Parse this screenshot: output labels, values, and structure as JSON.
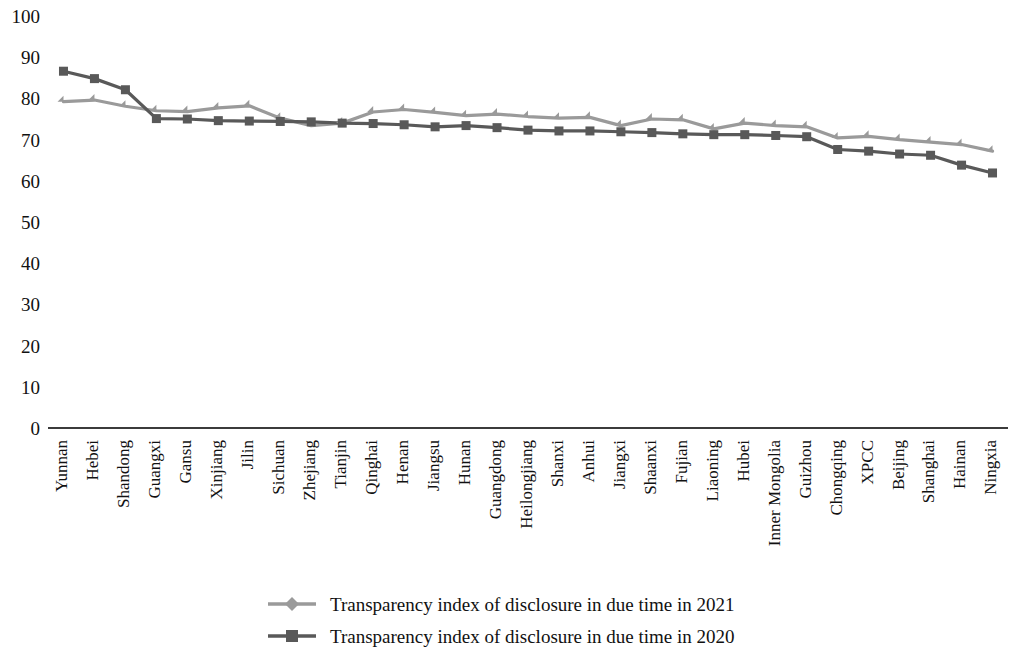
{
  "chart_data": {
    "type": "line",
    "title": "",
    "xlabel": "",
    "ylabel": "",
    "ylim": [
      0,
      100
    ],
    "ytick_step": 10,
    "yticks": [
      100,
      90,
      80,
      70,
      60,
      50,
      40,
      30,
      20,
      10,
      0
    ],
    "grid": false,
    "legend_position": "bottom",
    "categories": [
      "Yunnan",
      "Hebei",
      "Shandong",
      "Guangxi",
      "Gansu",
      "Xinjiang",
      "Jilin",
      "Sichuan",
      "Zhejiang",
      "Tianjin",
      "Qinghai",
      "Henan",
      "Jiangsu",
      "Hunan",
      "Guangdong",
      "Heilongjiang",
      "Shanxi",
      "Anhui",
      "Jiangxi",
      "Shaanxi",
      "Fujian",
      "Liaoning",
      "Hubei",
      "Inner Mongolia",
      "Guizhou",
      "Chongqing",
      "XPCC",
      "Beijing",
      "Shanghai",
      "Hainan",
      "Ningxia"
    ],
    "series": [
      {
        "name": "Transparency index of disclosure in due time in 2021",
        "color": "#9a9a9a",
        "marker": "diamond",
        "values": [
          79.2,
          79.6,
          78.1,
          77.0,
          76.8,
          77.7,
          78.2,
          75.2,
          73.4,
          74.0,
          76.7,
          77.3,
          76.6,
          75.8,
          76.2,
          75.6,
          75.2,
          75.4,
          73.4,
          75.0,
          74.8,
          72.6,
          74.0,
          73.4,
          73.1,
          70.4,
          70.8,
          70.0,
          69.4,
          68.8,
          67.2
        ]
      },
      {
        "name": "Transparency index of disclosure in due time in 2020",
        "color": "#595959",
        "marker": "square",
        "values": [
          86.6,
          84.8,
          82.1,
          75.1,
          75.0,
          74.6,
          74.5,
          74.4,
          74.3,
          74.0,
          73.9,
          73.6,
          73.1,
          73.4,
          72.9,
          72.3,
          72.1,
          72.1,
          71.9,
          71.7,
          71.4,
          71.2,
          71.2,
          71.0,
          70.7,
          67.6,
          67.2,
          66.5,
          66.2,
          63.8,
          61.9
        ]
      }
    ]
  },
  "legend": {
    "items": [
      {
        "label": "Transparency index of disclosure in due time in 2021"
      },
      {
        "label": "Transparency index of disclosure in due time in 2020"
      }
    ]
  }
}
